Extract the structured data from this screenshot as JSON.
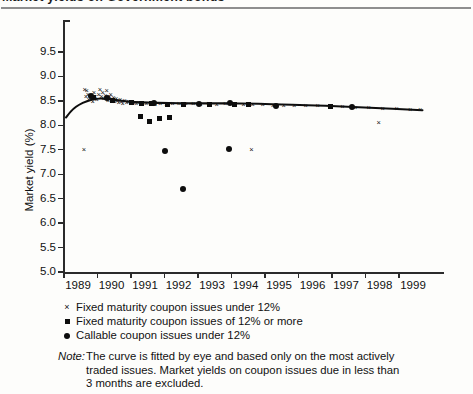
{
  "title_partial": "Market yields on Government bonds",
  "chart_data": {
    "type": "scatter",
    "title": "Market yields on Government bonds",
    "xlabel": "",
    "ylabel": "Market yield (%)",
    "xlim": [
      1988.85,
      1999.85
    ],
    "ylim": [
      5.0,
      9.75
    ],
    "x_ticks": [
      "1989",
      "1990",
      "1991",
      "1992",
      "1993",
      "1994",
      "1995",
      "1996",
      "1997",
      "1998",
      "1999"
    ],
    "y_ticks": [
      "5.0",
      "5.5",
      "6.0",
      "6.5",
      "7.0",
      "7.5",
      "8.0",
      "8.5",
      "9.0",
      "9.5"
    ],
    "grid": false,
    "legend_position": "below-axes",
    "legend": [
      {
        "marker": "x",
        "label": "Fixed maturity coupon issues under 12%"
      },
      {
        "marker": "square",
        "label": "Fixed maturity coupon issues of 12% or more"
      },
      {
        "marker": "circle",
        "label": "Callable coupon issues under 12%"
      }
    ],
    "series": [
      {
        "name": "Fixed maturity coupon issues under 12%",
        "marker": "x",
        "points": [
          [
            1989.6,
            8.72
          ],
          [
            1989.64,
            8.58
          ],
          [
            1989.66,
            8.7
          ],
          [
            1989.7,
            8.63
          ],
          [
            1989.72,
            8.52
          ],
          [
            1989.76,
            8.6
          ],
          [
            1989.8,
            8.55
          ],
          [
            1989.84,
            8.48
          ],
          [
            1989.88,
            8.66
          ],
          [
            1989.92,
            8.58
          ],
          [
            1989.96,
            8.51
          ],
          [
            1990.02,
            8.62
          ],
          [
            1990.06,
            8.72
          ],
          [
            1990.1,
            8.58
          ],
          [
            1990.14,
            8.66
          ],
          [
            1990.18,
            8.54
          ],
          [
            1990.22,
            8.6
          ],
          [
            1990.26,
            8.7
          ],
          [
            1990.3,
            8.5
          ],
          [
            1990.34,
            8.58
          ],
          [
            1990.38,
            8.62
          ],
          [
            1990.42,
            8.52
          ],
          [
            1990.46,
            8.56
          ],
          [
            1990.5,
            8.48
          ],
          [
            1990.54,
            8.54
          ],
          [
            1990.58,
            8.5
          ],
          [
            1990.62,
            8.46
          ],
          [
            1990.66,
            8.52
          ],
          [
            1990.7,
            8.48
          ],
          [
            1990.74,
            8.44
          ],
          [
            1990.8,
            8.5
          ],
          [
            1990.86,
            8.46
          ],
          [
            1990.92,
            8.48
          ],
          [
            1990.98,
            8.44
          ],
          [
            1991.06,
            8.46
          ],
          [
            1991.14,
            8.44
          ],
          [
            1991.22,
            8.45
          ],
          [
            1991.32,
            8.43
          ],
          [
            1991.44,
            8.44
          ],
          [
            1991.56,
            8.43
          ],
          [
            1991.7,
            8.42
          ],
          [
            1991.86,
            8.43
          ],
          [
            1992.04,
            8.42
          ],
          [
            1992.22,
            8.44
          ],
          [
            1992.42,
            8.43
          ],
          [
            1992.62,
            8.44
          ],
          [
            1992.84,
            8.43
          ],
          [
            1993.06,
            8.42
          ],
          [
            1993.3,
            8.43
          ],
          [
            1993.54,
            8.42
          ],
          [
            1993.8,
            8.43
          ],
          [
            1994.06,
            8.42
          ],
          [
            1994.34,
            8.42
          ],
          [
            1994.62,
            8.41
          ],
          [
            1994.92,
            8.41
          ],
          [
            1995.22,
            8.4
          ],
          [
            1995.54,
            8.4
          ],
          [
            1995.86,
            8.4
          ],
          [
            1996.2,
            8.39
          ],
          [
            1996.56,
            8.39
          ],
          [
            1996.92,
            8.38
          ],
          [
            1997.3,
            8.37
          ],
          [
            1997.68,
            8.36
          ],
          [
            1998.08,
            8.35
          ],
          [
            1998.5,
            8.34
          ],
          [
            1998.92,
            8.33
          ],
          [
            1999.32,
            8.32
          ],
          [
            1999.62,
            8.31
          ],
          [
            1989.58,
            7.5
          ],
          [
            1994.58,
            7.5
          ],
          [
            1998.38,
            8.04
          ]
        ]
      },
      {
        "name": "Fixed maturity coupon issues of 12% or more",
        "marker": "square",
        "points": [
          [
            1989.88,
            8.56
          ],
          [
            1990.46,
            8.5
          ],
          [
            1991.02,
            8.46
          ],
          [
            1991.3,
            8.45
          ],
          [
            1991.62,
            8.44
          ],
          [
            1992.08,
            8.43
          ],
          [
            1992.56,
            8.43
          ],
          [
            1993.34,
            8.43
          ],
          [
            1994.08,
            8.42
          ],
          [
            1994.5,
            8.42
          ],
          [
            1996.96,
            8.38
          ],
          [
            1991.28,
            8.18
          ],
          [
            1991.56,
            8.08
          ],
          [
            1991.86,
            8.13
          ],
          [
            1992.14,
            8.17
          ]
        ]
      },
      {
        "name": "Callable coupon issues under 12%",
        "marker": "circle",
        "points": [
          [
            1989.82,
            8.6
          ],
          [
            1990.28,
            8.55
          ],
          [
            1991.7,
            8.46
          ],
          [
            1993.04,
            8.44
          ],
          [
            1993.96,
            8.45
          ],
          [
            1995.34,
            8.4
          ],
          [
            1997.6,
            8.37
          ],
          [
            1992.02,
            7.48
          ],
          [
            1993.92,
            7.52
          ],
          [
            1992.56,
            6.7
          ]
        ]
      }
    ],
    "fitted_curve": {
      "description": "Curve fitted by eye",
      "points": [
        [
          1989.06,
          8.16
        ],
        [
          1989.2,
          8.28
        ],
        [
          1989.36,
          8.38
        ],
        [
          1989.56,
          8.46
        ],
        [
          1989.8,
          8.52
        ],
        [
          1990.1,
          8.55
        ],
        [
          1990.5,
          8.52
        ],
        [
          1991.0,
          8.48
        ],
        [
          1991.8,
          8.46
        ],
        [
          1992.8,
          8.45
        ],
        [
          1993.8,
          8.45
        ],
        [
          1994.8,
          8.44
        ],
        [
          1995.8,
          8.42
        ],
        [
          1996.8,
          8.4
        ],
        [
          1997.8,
          8.37
        ],
        [
          1998.8,
          8.34
        ],
        [
          1999.7,
          8.31
        ]
      ]
    }
  },
  "note": {
    "label": "Note:",
    "lines": [
      "The curve is fitted by eye and based only on the most actively",
      "traded issues.  Market yields on coupon issues due in less than",
      "3 months are excluded."
    ]
  },
  "colors": {
    "marker": "#0d0d0d",
    "axis": "#2b2b2b",
    "rule": "#8e8e8e",
    "background": "#fdfdfb"
  }
}
